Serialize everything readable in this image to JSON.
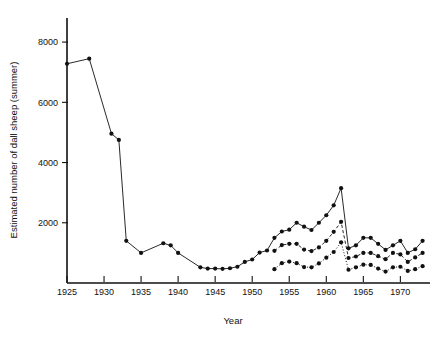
{
  "chart_data": {
    "type": "line",
    "title": "",
    "xlabel": "Year",
    "ylabel": "Estimated number of dall sheep (summer)",
    "xlim": [
      1925,
      1974
    ],
    "ylim": [
      0,
      8800
    ],
    "grid": false,
    "legend": "none",
    "xticks": [
      1925,
      1930,
      1935,
      1940,
      1945,
      1950,
      1955,
      1960,
      1965,
      1970
    ],
    "xtick_labels": [
      "1925",
      "1930",
      "1935",
      "1940",
      "1945",
      "1950",
      "1955",
      "1960",
      "1965",
      "1970"
    ],
    "yticks": [
      2000,
      4000,
      6000,
      8000
    ],
    "ytick_labels": [
      "2000",
      "4000",
      "6000",
      "8000"
    ],
    "series": [
      {
        "name": "total-estimate",
        "style": "solid",
        "marker": "filled-circle",
        "points": [
          [
            1925,
            7280
          ],
          [
            1928,
            7450
          ],
          [
            1931,
            4960
          ],
          [
            1932,
            4750
          ],
          [
            1933,
            1400
          ],
          [
            1935,
            1000
          ],
          [
            1938,
            1320
          ],
          [
            1939,
            1250
          ],
          [
            1940,
            1000
          ],
          [
            1943,
            520
          ],
          [
            1944,
            480
          ],
          [
            1945,
            480
          ],
          [
            1946,
            470
          ],
          [
            1947,
            490
          ],
          [
            1948,
            540
          ],
          [
            1949,
            700
          ],
          [
            1950,
            780
          ],
          [
            1951,
            1010
          ],
          [
            1952,
            1080
          ],
          [
            1953,
            1500
          ],
          [
            1954,
            1710
          ],
          [
            1955,
            1770
          ],
          [
            1956,
            2000
          ],
          [
            1957,
            1870
          ],
          [
            1958,
            1760
          ],
          [
            1959,
            2000
          ],
          [
            1960,
            2250
          ],
          [
            1961,
            2580
          ],
          [
            1962,
            3150
          ],
          [
            1963,
            1150
          ],
          [
            1964,
            1250
          ],
          [
            1965,
            1500
          ],
          [
            1966,
            1500
          ],
          [
            1967,
            1300
          ],
          [
            1968,
            1100
          ],
          [
            1969,
            1250
          ],
          [
            1970,
            1400
          ],
          [
            1971,
            1000
          ],
          [
            1972,
            1120
          ],
          [
            1973,
            1400
          ]
        ]
      },
      {
        "name": "mid-estimate",
        "style": "dashed",
        "marker": "filled-circle",
        "points": [
          [
            1953,
            1070
          ],
          [
            1954,
            1260
          ],
          [
            1955,
            1300
          ],
          [
            1956,
            1300
          ],
          [
            1957,
            1110
          ],
          [
            1958,
            1060
          ],
          [
            1959,
            1180
          ],
          [
            1960,
            1400
          ],
          [
            1961,
            1700
          ],
          [
            1962,
            2030
          ],
          [
            1963,
            830
          ],
          [
            1964,
            880
          ],
          [
            1965,
            1000
          ],
          [
            1966,
            1000
          ],
          [
            1967,
            890
          ],
          [
            1968,
            790
          ],
          [
            1969,
            1000
          ],
          [
            1970,
            950
          ],
          [
            1971,
            700
          ],
          [
            1972,
            850
          ],
          [
            1973,
            1000
          ]
        ]
      },
      {
        "name": "low-estimate",
        "style": "dotted",
        "marker": "filled-circle",
        "points": [
          [
            1953,
            460
          ],
          [
            1954,
            660
          ],
          [
            1955,
            710
          ],
          [
            1956,
            660
          ],
          [
            1957,
            530
          ],
          [
            1958,
            520
          ],
          [
            1959,
            650
          ],
          [
            1960,
            840
          ],
          [
            1961,
            1030
          ],
          [
            1962,
            1350
          ],
          [
            1963,
            440
          ],
          [
            1964,
            520
          ],
          [
            1965,
            610
          ],
          [
            1966,
            600
          ],
          [
            1967,
            480
          ],
          [
            1968,
            380
          ],
          [
            1969,
            520
          ],
          [
            1970,
            540
          ],
          [
            1971,
            400
          ],
          [
            1972,
            460
          ],
          [
            1973,
            560
          ]
        ]
      }
    ]
  },
  "layout": {
    "plot_left": 67,
    "plot_right": 430,
    "plot_top": 18,
    "plot_bottom": 283
  }
}
